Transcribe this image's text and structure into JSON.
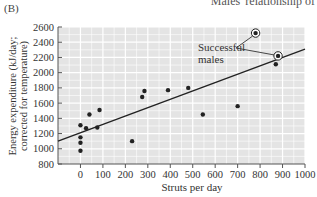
{
  "panel_label": "(B)",
  "header_fragment": "Males' relationship of",
  "annotation": {
    "line1": "Successful",
    "line2": "males"
  },
  "chart_data": {
    "type": "scatter",
    "title": "",
    "xlabel": "Struts per day",
    "ylabel_line1": "Energy expenditure (kJ/day;",
    "ylabel_line2": "corrected for temperature)",
    "xlim": [
      -100,
      1000
    ],
    "ylim": [
      800,
      2600
    ],
    "x_ticks": [
      0,
      100,
      200,
      300,
      400,
      500,
      600,
      700,
      800,
      900,
      1000
    ],
    "y_ticks": [
      800,
      1000,
      1200,
      1400,
      1600,
      1800,
      2000,
      2200,
      2400,
      2600
    ],
    "grid": true,
    "background": "#e4e4e4",
    "series": [
      {
        "name": "Males",
        "points": [
          {
            "x": 0,
            "y": 1310
          },
          {
            "x": 0,
            "y": 1150
          },
          {
            "x": 0,
            "y": 1080
          },
          {
            "x": 0,
            "y": 975
          },
          {
            "x": 25,
            "y": 1270
          },
          {
            "x": 40,
            "y": 1450
          },
          {
            "x": 75,
            "y": 1280
          },
          {
            "x": 85,
            "y": 1510
          },
          {
            "x": 230,
            "y": 1100
          },
          {
            "x": 275,
            "y": 1680
          },
          {
            "x": 285,
            "y": 1760
          },
          {
            "x": 390,
            "y": 1770
          },
          {
            "x": 480,
            "y": 1800
          },
          {
            "x": 545,
            "y": 1450
          },
          {
            "x": 700,
            "y": 1560
          },
          {
            "x": 870,
            "y": 2110
          }
        ]
      },
      {
        "name": "Successful males",
        "circled": true,
        "points": [
          {
            "x": 780,
            "y": 2520
          },
          {
            "x": 880,
            "y": 2220
          }
        ]
      }
    ],
    "regression_line": {
      "x": [
        -100,
        1000
      ],
      "y": [
        1100,
        2310
      ]
    }
  }
}
